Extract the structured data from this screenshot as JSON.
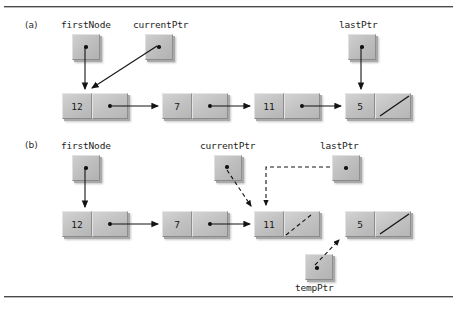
{
  "figure": {
    "panels": [
      {
        "id": "a",
        "label": "(a)",
        "pointers": [
          {
            "name": "firstNode",
            "label": "firstNode"
          },
          {
            "name": "currentPtr",
            "label": "currentPtr"
          },
          {
            "name": "lastPtr",
            "label": "lastPtr"
          }
        ],
        "nodes": [
          {
            "value": "12",
            "link": "dot"
          },
          {
            "value": "7",
            "link": "dot"
          },
          {
            "value": "11",
            "link": "dot"
          },
          {
            "value": "5",
            "link": "null-slash"
          }
        ]
      },
      {
        "id": "b",
        "label": "(b)",
        "pointers": [
          {
            "name": "firstNode",
            "label": "firstNode"
          },
          {
            "name": "currentPtr",
            "label": "currentPtr"
          },
          {
            "name": "lastPtr",
            "label": "lastPtr"
          },
          {
            "name": "tempPtr",
            "label": "tempPtr"
          }
        ],
        "nodes": [
          {
            "value": "12",
            "link": "dot"
          },
          {
            "value": "7",
            "link": "dot"
          },
          {
            "value": "11",
            "link": "dashed-slash"
          },
          {
            "value": "5",
            "link": "null-slash"
          }
        ]
      }
    ],
    "colors": {
      "box_face": "#c2c2c2",
      "box_highlight": "#e2e2e2",
      "box_shadow": "#8a8a8a",
      "arrow": "#1a1a1a",
      "rule": "#4a4a4a",
      "text": "#1d1d1d",
      "background": "#ffffff"
    }
  }
}
